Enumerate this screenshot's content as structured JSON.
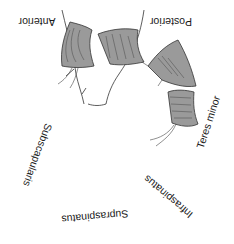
{
  "diagram": {
    "orientation_rotation_deg": 180,
    "labels": {
      "anterior": "Anterior",
      "posterior": "Posterior",
      "teres_minor": "Teres minor",
      "infraspinatus": "Infraspinatus",
      "supraspinatus": "Supraspinatus",
      "subscapularis": "Subscapularis"
    },
    "colors": {
      "muscle_fill": "#9a9a9a",
      "outline": "#333333",
      "background": "#ffffff"
    }
  }
}
